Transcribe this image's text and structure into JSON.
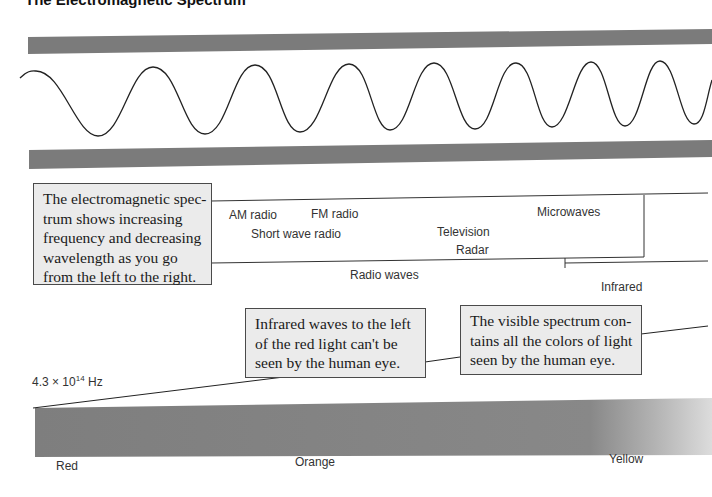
{
  "header": {
    "title": "The Electromagnetic Spectrum"
  },
  "colors": {
    "band": "#7b7b7b",
    "callout_fill": "#ebebeb",
    "callout_border": "#4a4a4a",
    "spectrum_dark": "#808080",
    "spectrum_light": "#d9d9d9",
    "wave_stroke": "#222222"
  },
  "wave": {
    "peaks_x": [
      36,
      153,
      255,
      349,
      434,
      516,
      591,
      660
    ],
    "troughs_x": [
      98,
      205,
      300,
      390,
      475,
      552,
      625,
      694
    ],
    "note": "wavelength decreases from left to right"
  },
  "callouts": [
    {
      "id": "spectrum-overview",
      "lines": [
        "The electromagnetic spec-",
        "trum shows increasing",
        "frequency and decreasing",
        "wavelength as you go",
        "from the left to the right."
      ]
    },
    {
      "id": "infrared-note",
      "lines": [
        "Infrared waves to the left",
        "of the red light can't be",
        "seen by the human eye."
      ]
    },
    {
      "id": "visible-note",
      "lines": [
        "The visible spectrum con-",
        "tains all the colors of light",
        "seen by the human eye."
      ]
    }
  ],
  "radio_section": {
    "labels": {
      "am_radio": "AM radio",
      "fm_radio": "FM radio",
      "short_wave": "Short wave radio",
      "television": "Television",
      "radar": "Radar",
      "microwaves": "Microwaves",
      "radio_waves": "Radio waves",
      "infrared": "Infrared"
    }
  },
  "frequency_label": {
    "mantissa": "4.3 × 10",
    "exponent": "14",
    "unit": " Hz"
  },
  "visible_spectrum": {
    "colors": [
      "Red",
      "Orange",
      "Yellow"
    ]
  }
}
